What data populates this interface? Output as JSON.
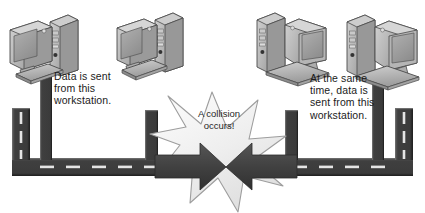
{
  "diagram": {
    "colors": {
      "background": "#ffffff",
      "cable_dark": "#3f3f3f",
      "cable_edge": "#2a2a2a",
      "cable_dash": "#e8e8e8",
      "arrow_dark": "#404040",
      "star_fill": "#ededed",
      "star_edge": "#9a9a9a",
      "computer_body": "#b9b9b9",
      "computer_shade": "#8d8d8d",
      "computer_screen": "#a2a2a2",
      "computer_outline": "#4a4a4a",
      "text": "#1b1b1b"
    },
    "callouts": [
      {
        "id": "left",
        "text": "Data is sent\nfrom this\nworkstation."
      },
      {
        "id": "right",
        "text": "At the same\ntime, data is\nsent from this\nworkstation."
      }
    ],
    "collision": {
      "label": "A collision\noccurs!"
    },
    "workstations": [
      {
        "id": "ws-1",
        "orientation": "tower-right"
      },
      {
        "id": "ws-2",
        "orientation": "tower-right"
      },
      {
        "id": "ws-3",
        "orientation": "tower-left"
      },
      {
        "id": "ws-4",
        "orientation": "tower-left"
      }
    ],
    "signals": [
      {
        "id": "signal-left-to-center",
        "direction": "right"
      },
      {
        "id": "signal-right-to-center",
        "direction": "left"
      }
    ]
  }
}
